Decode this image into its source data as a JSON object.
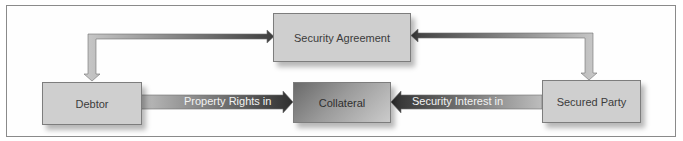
{
  "diagram": {
    "nodes": {
      "security_agreement": "Security Agreement",
      "debtor": "Debtor",
      "collateral": "Collateral",
      "secured_party": "Secured Party"
    },
    "edges": [
      {
        "from": "debtor",
        "to": "collateral",
        "label": "Property Rights in"
      },
      {
        "from": "secured_party",
        "to": "collateral",
        "label": "Security Interest in"
      },
      {
        "from": "debtor",
        "to": "security_agreement",
        "label": "",
        "bidirectional": true
      },
      {
        "from": "secured_party",
        "to": "security_agreement",
        "label": "",
        "bidirectional": true
      }
    ],
    "colors": {
      "box_fill": "#cfcfcf",
      "box_border": "#7d7d7d",
      "arrow_dark": "#3a3a3a",
      "arrow_light": "#c8c8c8",
      "frame_border": "#8a8a8a"
    }
  }
}
